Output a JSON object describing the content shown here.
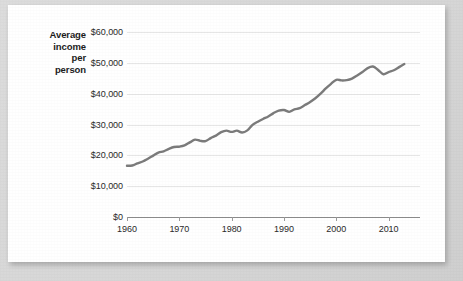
{
  "chart_data": {
    "type": "line",
    "title": "",
    "subtitle": "",
    "ylabel": "Average income per person",
    "ylabel_lines": [
      "Average",
      "income",
      "per",
      "person"
    ],
    "xlabel": "",
    "ylim": [
      0,
      60000
    ],
    "xlim": [
      1960,
      2016
    ],
    "grid": true,
    "legend": null,
    "line_color": "#7b7b7b",
    "gridline_color": "#e6e6e6",
    "axis_color": "#8c8c8c",
    "ytick_labels": [
      "$60,000",
      "$50,000",
      "$40,000",
      "$30,000",
      "$20,000",
      "$10,000",
      "$0"
    ],
    "ytick_values": [
      60000,
      50000,
      40000,
      30000,
      20000,
      10000,
      0
    ],
    "xtick_labels": [
      "1960",
      "1970",
      "1980",
      "1990",
      "2000",
      "2010"
    ],
    "xtick_values": [
      1960,
      1970,
      1980,
      1990,
      2000,
      2010
    ],
    "series": [
      {
        "name": "Average income per person",
        "x": [
          1960,
          1961,
          1962,
          1963,
          1964,
          1965,
          1966,
          1967,
          1968,
          1969,
          1970,
          1971,
          1972,
          1973,
          1974,
          1975,
          1976,
          1977,
          1978,
          1979,
          1980,
          1981,
          1982,
          1983,
          1984,
          1985,
          1986,
          1987,
          1988,
          1989,
          1990,
          1991,
          1992,
          1993,
          1994,
          1995,
          1996,
          1997,
          1998,
          1999,
          2000,
          2001,
          2002,
          2003,
          2004,
          2005,
          2006,
          2007,
          2008,
          2009,
          2010,
          2011,
          2012,
          2013
        ],
        "values": [
          16600,
          16700,
          17400,
          18000,
          18900,
          19900,
          20900,
          21300,
          22100,
          22700,
          22800,
          23200,
          24200,
          25100,
          24700,
          24600,
          25600,
          26400,
          27500,
          28000,
          27600,
          28000,
          27400,
          28100,
          29900,
          30900,
          31800,
          32600,
          33700,
          34500,
          34700,
          34100,
          34900,
          35300,
          36300,
          37300,
          38500,
          40000,
          41700,
          43200,
          44500,
          44300,
          44400,
          44900,
          45900,
          47000,
          48300,
          48800,
          47700,
          46300,
          47000,
          47600,
          48600,
          49600
        ]
      }
    ]
  },
  "figure": {
    "background": "#ffffff",
    "page_background": "#d9d9d9"
  }
}
